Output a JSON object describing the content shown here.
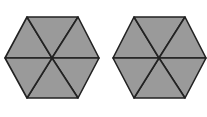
{
  "diagram": {
    "type": "hexagon-pair",
    "fill_color": "#9a9a9a",
    "stroke_color": "#222222",
    "background": "#ffffff",
    "shapes": [
      {
        "name": "left-hexagon",
        "center": [
          52,
          58
        ],
        "vertices": [
          [
            5,
            58
          ],
          [
            27,
            17
          ],
          [
            78,
            17
          ],
          [
            99,
            58
          ],
          [
            78,
            98
          ],
          [
            27,
            98
          ]
        ],
        "triangles": 6,
        "shaded_triangles": 6
      },
      {
        "name": "right-hexagon",
        "center": [
          159,
          58
        ],
        "vertices": [
          [
            113,
            58
          ],
          [
            134,
            17
          ],
          [
            185,
            17
          ],
          [
            206,
            58
          ],
          [
            185,
            98
          ],
          [
            134,
            98
          ]
        ],
        "triangles": 6,
        "shaded_triangles": 6
      }
    ]
  }
}
